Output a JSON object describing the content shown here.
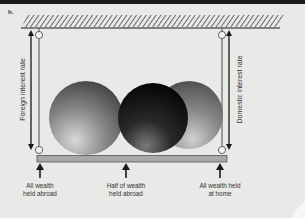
{
  "panel": {
    "label": "b."
  },
  "axes": {
    "left_label": "Foreign interest rate",
    "right_label": "Domestic interest rate"
  },
  "captions": [
    {
      "id": "left",
      "line1": "All wealth",
      "line2": "held abroad"
    },
    {
      "id": "middle",
      "line1": "Half of wealth",
      "line2": "held abroad"
    },
    {
      "id": "right",
      "line1": "All wealth held",
      "line2": "at home"
    }
  ],
  "colors": {
    "background": "#e9e9e7",
    "ink": "#1a1a1a",
    "bar": "#a8a8a8",
    "ceiling_hatch": "#555555"
  }
}
